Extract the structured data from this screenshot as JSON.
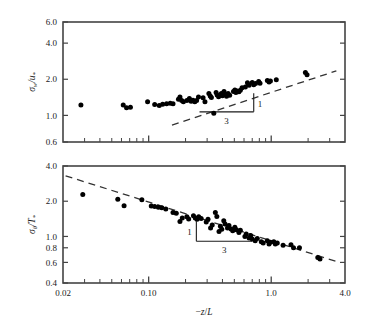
{
  "figure": {
    "background_color": "#ffffff",
    "marker_color": "#000000",
    "axis_color": "#444444",
    "fit_line_color": "#333333"
  },
  "chart_data": [
    {
      "type": "scatter",
      "panel": "top",
      "title": "",
      "xlabel": "",
      "ylabel": "σ_w/u_*",
      "ylabel_parts": {
        "sigma": "σ",
        "sub1": "w",
        "slash": "/",
        "u": "u",
        "sub2": "*"
      },
      "xscale": "log",
      "yscale": "log",
      "xlim": [
        0.02,
        4.0
      ],
      "ylim": [
        0.6,
        6.0
      ],
      "xticks": [
        0.02,
        0.1,
        1.0,
        4.0
      ],
      "xticklabels": [
        "0.02",
        "0.10",
        "1.0",
        "4.0"
      ],
      "yticks": [
        0.6,
        1.0,
        2.0,
        4.0,
        6.0
      ],
      "yticklabels": [
        "0.6",
        "1.0",
        "2.0",
        "4.0",
        "6.0"
      ],
      "grid": false,
      "legend": "none",
      "fit_line": {
        "style": "dashed",
        "slope_exponent": 0.3333,
        "x_start": 0.155,
        "y_start": 0.83,
        "x_end": 3.4,
        "y_end": 2.35
      },
      "slope_triangle": {
        "vertical_label": "1",
        "horizontal_label": "3",
        "x_left": 0.26,
        "x_right": 0.72,
        "y_bottom": 1.07,
        "y_top": 1.53
      },
      "points": [
        [
          0.028,
          1.22
        ],
        [
          0.062,
          1.22
        ],
        [
          0.066,
          1.16
        ],
        [
          0.071,
          1.17
        ],
        [
          0.098,
          1.3
        ],
        [
          0.112,
          1.23
        ],
        [
          0.122,
          1.21
        ],
        [
          0.13,
          1.24
        ],
        [
          0.14,
          1.25
        ],
        [
          0.15,
          1.26
        ],
        [
          0.158,
          1.25
        ],
        [
          0.175,
          1.36
        ],
        [
          0.18,
          1.42
        ],
        [
          0.186,
          1.33
        ],
        [
          0.192,
          1.3
        ],
        [
          0.205,
          1.33
        ],
        [
          0.215,
          1.38
        ],
        [
          0.222,
          1.31
        ],
        [
          0.23,
          1.34
        ],
        [
          0.238,
          1.3
        ],
        [
          0.246,
          1.33
        ],
        [
          0.255,
          1.42
        ],
        [
          0.278,
          1.4
        ],
        [
          0.288,
          1.3
        ],
        [
          0.31,
          1.52
        ],
        [
          0.318,
          1.45
        ],
        [
          0.325,
          1.41
        ],
        [
          0.34,
          1.04
        ],
        [
          0.355,
          1.55
        ],
        [
          0.362,
          1.48
        ],
        [
          0.372,
          1.43
        ],
        [
          0.392,
          1.52
        ],
        [
          0.4,
          1.46
        ],
        [
          0.412,
          1.58
        ],
        [
          0.422,
          1.5
        ],
        [
          0.432,
          1.44
        ],
        [
          0.445,
          1.52
        ],
        [
          0.458,
          1.47
        ],
        [
          0.492,
          1.58
        ],
        [
          0.505,
          1.63
        ],
        [
          0.515,
          1.55
        ],
        [
          0.528,
          1.6
        ],
        [
          0.545,
          1.57
        ],
        [
          0.56,
          1.62
        ],
        [
          0.578,
          1.7
        ],
        [
          0.615,
          1.72
        ],
        [
          0.64,
          1.87
        ],
        [
          0.66,
          1.78
        ],
        [
          0.7,
          1.88
        ],
        [
          0.72,
          1.8
        ],
        [
          0.745,
          1.84
        ],
        [
          0.79,
          1.92
        ],
        [
          0.81,
          1.85
        ],
        [
          0.93,
          1.95
        ],
        [
          0.96,
          1.9
        ],
        [
          0.985,
          1.93
        ],
        [
          1.1,
          1.98
        ],
        [
          1.9,
          2.28
        ],
        [
          1.96,
          2.18
        ]
      ]
    },
    {
      "type": "scatter",
      "panel": "bottom",
      "title": "",
      "xlabel": "−z/L",
      "xlabel_parts": {
        "minus": "−",
        "z": "z",
        "slash": "/",
        "L": "L"
      },
      "ylabel": "σ_θ/T_*",
      "ylabel_parts": {
        "sigma": "σ",
        "sub1": "θ",
        "slash": "/",
        "T": "T",
        "sub2": "*"
      },
      "xscale": "log",
      "yscale": "log",
      "xlim": [
        0.02,
        4.0
      ],
      "ylim": [
        0.4,
        4.0
      ],
      "xticks": [
        0.02,
        0.1,
        1.0,
        4.0
      ],
      "xticklabels": [
        "0.02",
        "0.10",
        "1.0",
        "4.0"
      ],
      "yticks": [
        0.4,
        0.6,
        0.8,
        1.0,
        2.0,
        4.0
      ],
      "yticklabels": [
        "0.4",
        "0.6",
        "0.8",
        "1.0",
        "2.0",
        "4.0"
      ],
      "grid": false,
      "legend": "none",
      "fit_line": {
        "style": "dashed",
        "slope_exponent": -0.3333,
        "x_start": 0.021,
        "y_start": 3.3,
        "x_end": 3.6,
        "y_end": 0.6
      },
      "slope_triangle": {
        "vertical_label": "1",
        "horizontal_label": "3",
        "x_left": 0.245,
        "x_right": 0.7,
        "y_bottom": 0.91,
        "y_top": 1.35
      },
      "points": [
        [
          0.029,
          2.28
        ],
        [
          0.056,
          2.08
        ],
        [
          0.063,
          1.83
        ],
        [
          0.088,
          2.06
        ],
        [
          0.105,
          1.82
        ],
        [
          0.112,
          1.8
        ],
        [
          0.12,
          1.78
        ],
        [
          0.128,
          1.76
        ],
        [
          0.138,
          1.72
        ],
        [
          0.158,
          1.6
        ],
        [
          0.168,
          1.58
        ],
        [
          0.18,
          1.34
        ],
        [
          0.188,
          1.44
        ],
        [
          0.205,
          1.47
        ],
        [
          0.212,
          1.41
        ],
        [
          0.232,
          1.5
        ],
        [
          0.24,
          1.44
        ],
        [
          0.248,
          1.4
        ],
        [
          0.256,
          1.47
        ],
        [
          0.268,
          1.42
        ],
        [
          0.295,
          1.33
        ],
        [
          0.305,
          1.4
        ],
        [
          0.32,
          1.18
        ],
        [
          0.33,
          1.25
        ],
        [
          0.35,
          1.6
        ],
        [
          0.36,
          1.48
        ],
        [
          0.375,
          1.1
        ],
        [
          0.385,
          1.22
        ],
        [
          0.395,
          1.15
        ],
        [
          0.41,
          1.36
        ],
        [
          0.42,
          1.28
        ],
        [
          0.44,
          1.18
        ],
        [
          0.452,
          1.24
        ],
        [
          0.47,
          1.16
        ],
        [
          0.485,
          1.12
        ],
        [
          0.505,
          1.2
        ],
        [
          0.52,
          1.14
        ],
        [
          0.545,
          1.08
        ],
        [
          0.56,
          1.13
        ],
        [
          0.61,
          1.0
        ],
        [
          0.625,
          1.05
        ],
        [
          0.66,
          0.97
        ],
        [
          0.68,
          1.02
        ],
        [
          0.7,
          0.95
        ],
        [
          0.74,
          0.92
        ],
        [
          0.77,
          0.96
        ],
        [
          0.83,
          0.9
        ],
        [
          0.86,
          0.88
        ],
        [
          0.93,
          0.92
        ],
        [
          0.96,
          0.86
        ],
        [
          0.985,
          0.89
        ],
        [
          1.05,
          0.9
        ],
        [
          1.08,
          0.86
        ],
        [
          1.12,
          0.88
        ],
        [
          1.25,
          0.84
        ],
        [
          1.45,
          0.85
        ],
        [
          1.52,
          0.8
        ],
        [
          1.7,
          0.8
        ],
        [
          2.4,
          0.66
        ],
        [
          2.5,
          0.64
        ]
      ]
    }
  ]
}
